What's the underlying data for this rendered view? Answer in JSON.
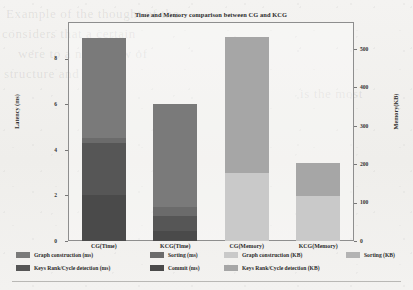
{
  "chart_data": {
    "type": "bar",
    "subtype": "stacked-bar-dual-axis",
    "title": "Time and Memory comparison between CG and KCG",
    "categories": [
      "CG(Time)",
      "KCG(Time)",
      "CG(Memory)",
      "KCG(Memory)"
    ],
    "xlabel": "",
    "left_axis": {
      "label": "Latency (ms)",
      "ticks": [
        0,
        2,
        4,
        6,
        8
      ],
      "ylim": [
        0,
        9.6
      ],
      "unit": "ms"
    },
    "right_axis": {
      "label": "Memory(KB)",
      "ticks": [
        0,
        100,
        200,
        300,
        400,
        500
      ],
      "ylim": [
        0,
        570
      ],
      "unit": "KB"
    },
    "grid": false,
    "legend_position": "below",
    "series": [
      {
        "name": "Graph construction (ms)",
        "axis": "left",
        "color": "#7a7a7a",
        "values": [
          4.4,
          4.5,
          null,
          null
        ]
      },
      {
        "name": "Sorting (ms)",
        "axis": "left",
        "color": "#6b6b6b",
        "values": [
          0.2,
          0.42,
          null,
          null
        ]
      },
      {
        "name": "Keys Rank/Cycle detection (ms)",
        "axis": "left",
        "color": "#565656",
        "values": [
          2.3,
          0.62,
          null,
          null
        ]
      },
      {
        "name": "Commit (ms)",
        "axis": "left",
        "color": "#4a4a4a",
        "values": [
          2.0,
          0.46,
          null,
          null
        ]
      },
      {
        "name": "Graph construction (KB)",
        "axis": "right",
        "color": "#c9c9c9",
        "values": [
          null,
          null,
          178,
          118
        ]
      },
      {
        "name": "Sorting (KB)",
        "axis": "right",
        "color": "#b3b3b3",
        "values": [
          null,
          null,
          0,
          0
        ]
      },
      {
        "name": "Keys Rank/Cycle detection (KB)",
        "axis": "right",
        "color": "#a6a6a6",
        "values": [
          null,
          null,
          353,
          84
        ]
      }
    ],
    "bar_totals": {
      "CG(Time)": 8.9,
      "KCG(Time)": 6.0,
      "CG(Memory)": 531,
      "KCG(Memory)": 202
    }
  },
  "legend": {
    "row1": [
      {
        "label": "Graph construction (ms)",
        "color": "#7a7a7a"
      },
      {
        "label": "Sorting (ms)",
        "color": "#6b6b6b"
      },
      {
        "label": "Graph construction (KB)",
        "color": "#c9c9c9"
      },
      {
        "label": "Sorting (KB)",
        "color": "#b3b3b3"
      }
    ],
    "row2": [
      {
        "label": "Keys Rank/Cycle detection (ms)",
        "color": "#565656"
      },
      {
        "label": "Commit (ms)",
        "color": "#4a4a4a"
      },
      {
        "label": "Keys Rank/Cycle detection (KB)",
        "color": "#a6a6a6"
      }
    ]
  },
  "ticks": {
    "left": [
      "8",
      "6",
      "4",
      "2",
      "0"
    ],
    "right": [
      "500",
      "400",
      "300",
      "200",
      "100",
      "0"
    ]
  },
  "xlabels": [
    "CG(Time)",
    "KCG(Time)",
    "CG(Memory)",
    "KCG(Memory)"
  ],
  "page_bleed": {
    "l1": "Example of the   thought   of the",
    "l2": "considers   that   a   certain",
    "l3": "were to   a new   View  of",
    "l4": "structure and   the",
    "l5": "is  the  most"
  }
}
